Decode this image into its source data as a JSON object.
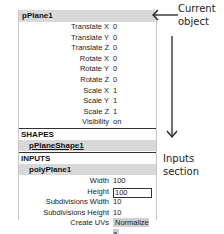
{
  "panel": {
    "title": "pPlane1",
    "transform_attrs": [
      {
        "label": "Translate X",
        "value": "0"
      },
      {
        "label": "Translate Y",
        "value": "0"
      },
      {
        "label": "Translate Z",
        "value": "0"
      },
      {
        "label": "Rotate X",
        "value": "0"
      },
      {
        "label": "Rotate Y",
        "value": "0"
      },
      {
        "label": "Rotate Z",
        "value": "0"
      },
      {
        "label": "Scale X",
        "value": "1"
      },
      {
        "label": "Scale Y",
        "value": "1"
      },
      {
        "label": "Scale Z",
        "value": "1"
      },
      {
        "label": "Visibility",
        "value": "on"
      }
    ],
    "shapes": {
      "header": "SHAPES",
      "node": "pPlaneShape1"
    },
    "inputs": {
      "header": "INPUTS",
      "node": "polyPlane1",
      "attrs": [
        {
          "label": "Width",
          "value": "100"
        },
        {
          "label": "Height",
          "value": "100"
        },
        {
          "label": "Subdivisions Width",
          "value": "10"
        },
        {
          "label": "Subdivisions Height",
          "value": "10"
        },
        {
          "label": "Create UVs",
          "value": "Normalize a"
        }
      ]
    }
  },
  "annotations": {
    "current_object_line1": "Current",
    "current_object_line2": "object",
    "inputs_section_line1": "Inputs",
    "inputs_section_line2": "section"
  }
}
